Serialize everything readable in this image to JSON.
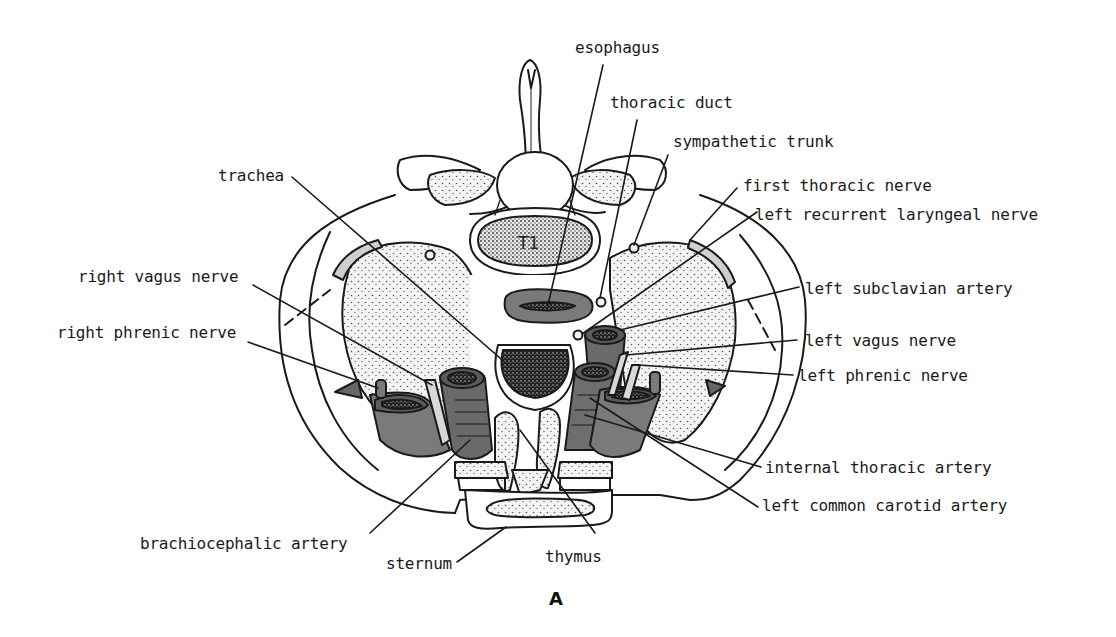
{
  "figure": {
    "panel_letter": "A",
    "vertebra_label": "T1"
  },
  "labels": {
    "esophagus": "esophagus",
    "thoracic_duct": "thoracic duct",
    "sympathetic_trunk": "sympathetic trunk",
    "trachea": "trachea",
    "first_thoracic_nerve": "first thoracic nerve",
    "left_recurrent_laryngeal_nerve": "left recurrent laryngeal nerve",
    "right_vagus_nerve": "right vagus nerve",
    "left_subclavian_artery": "left subclavian artery",
    "right_phrenic_nerve": "right phrenic nerve",
    "left_vagus_nerve": "left vagus nerve",
    "left_phrenic_nerve": "left phrenic nerve",
    "internal_thoracic_artery": "internal thoracic artery",
    "left_common_carotid_artery": "left common carotid artery",
    "brachiocephalic_artery": "brachiocephalic artery",
    "sternum": "sternum",
    "thymus": "thymus"
  },
  "colors": {
    "line": "#1a1a1a",
    "vessel_dark": "#6b6b6b",
    "vessel_mid": "#8a8a8a",
    "lumen": "#2a2a2a",
    "lung_stipple_bg": "#efefef",
    "pleura_band": "#cfcfcf"
  }
}
